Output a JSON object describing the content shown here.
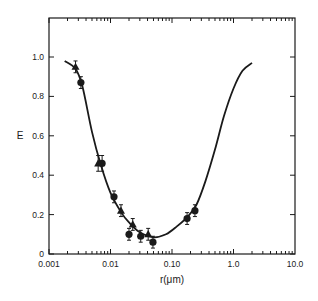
{
  "chart_data": {
    "type": "scatter",
    "title": "",
    "xlabel": "r(μm)",
    "ylabel": "E",
    "xscale": "log",
    "xlim": [
      0.001,
      10.0
    ],
    "ylim": [
      0,
      1.2
    ],
    "x_ticks": [
      "0.001",
      "0.01",
      "0.10",
      "1.0",
      "10.0"
    ],
    "y_ticks": [
      "0",
      "0.2",
      "0.4",
      "0.6",
      "0.8",
      "1.0"
    ],
    "grid": false,
    "legend": null,
    "series": [
      {
        "name": "triangles",
        "marker": "triangle",
        "x": [
          0.0027,
          0.0063,
          0.0148,
          0.023,
          0.041
        ],
        "y": [
          0.95,
          0.46,
          0.22,
          0.15,
          0.1
        ],
        "err": [
          0.03,
          0.04,
          0.03,
          0.03,
          0.03
        ]
      },
      {
        "name": "circles",
        "marker": "circle",
        "x": [
          0.0033,
          0.0073,
          0.0114,
          0.02,
          0.031,
          0.049,
          0.176,
          0.236
        ],
        "y": [
          0.87,
          0.46,
          0.29,
          0.1,
          0.09,
          0.06,
          0.18,
          0.22
        ],
        "err": [
          0.03,
          0.04,
          0.03,
          0.03,
          0.03,
          0.03,
          0.03,
          0.03
        ]
      },
      {
        "name": "fit curve",
        "marker": "line",
        "x": [
          0.0018,
          0.0027,
          0.0035,
          0.005,
          0.007,
          0.01,
          0.015,
          0.02,
          0.03,
          0.05,
          0.08,
          0.12,
          0.18,
          0.25,
          0.35,
          0.5,
          0.7,
          1.0,
          1.4,
          2.0
        ],
        "y": [
          0.98,
          0.94,
          0.85,
          0.62,
          0.45,
          0.31,
          0.21,
          0.16,
          0.11,
          0.085,
          0.1,
          0.14,
          0.19,
          0.25,
          0.37,
          0.53,
          0.7,
          0.84,
          0.93,
          0.97
        ]
      }
    ]
  }
}
